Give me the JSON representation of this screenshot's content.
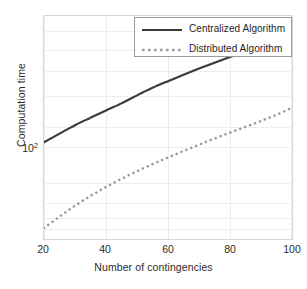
{
  "figure": {
    "background_color": "#ffffff",
    "axes_border_color": "#d8d8d8",
    "grid_color": "#ededed"
  },
  "chart_data": {
    "type": "line",
    "title": "",
    "xlabel": "Number of contingencies",
    "ylabel": "Computation time",
    "xscale": "linear",
    "yscale": "log",
    "xlim": [
      20,
      100
    ],
    "ylim": [
      10.5,
      420
    ],
    "grid": true,
    "xticks": [
      "20",
      "40",
      "60",
      "80",
      "100"
    ],
    "xtick_values": [
      20,
      40,
      60,
      80,
      100
    ],
    "yticks": [
      "10",
      "2"
    ],
    "ytick_label": "10",
    "ytick_exponent": "2",
    "ytick_values": [
      100
    ],
    "legend_position": "upper right",
    "x": [
      20,
      25,
      30,
      35,
      40,
      45,
      50,
      55,
      60,
      65,
      70,
      75,
      80,
      85,
      90,
      95,
      100
    ],
    "series": [
      {
        "name": "Centralized Algorithm",
        "label": "Centralized Algorithm",
        "style": "solid",
        "color": "#3a3a3a",
        "width": 2.2,
        "values": [
          52,
          60,
          69,
          78,
          88,
          99,
          113,
          128,
          143,
          159,
          176,
          194,
          213,
          233,
          255,
          281,
          310
        ]
      },
      {
        "name": "Distributed Algorithm",
        "label": "Distributed Algorithm",
        "style": "dotted",
        "color": "#9b9b9b",
        "width": 2.6,
        "values": [
          12.6,
          15.2,
          18.2,
          21.4,
          24.8,
          28.4,
          32.2,
          36.2,
          40.4,
          45.0,
          50.0,
          55.4,
          61.0,
          67.2,
          74.0,
          82.0,
          92.0
        ]
      }
    ]
  }
}
